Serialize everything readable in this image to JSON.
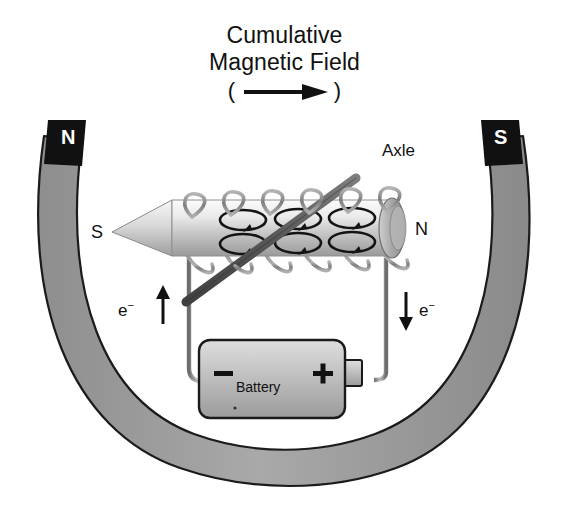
{
  "figure": {
    "type": "diagram",
    "title_line1": "Cumulative",
    "title_line2": "Magnetic Field",
    "title_line3_open": "(",
    "title_line3_arrow": "arrow-right-icon",
    "title_line3_close": ")"
  },
  "horseshoe_magnet": {
    "north_pole_label": "N",
    "south_pole_label": "S",
    "pole_block_color": "#111111",
    "pole_text_color": "#ffffff",
    "band_color": "#9b9b9b",
    "band_outline": "#1a1a1a"
  },
  "solenoid": {
    "left_pole_label": "S",
    "right_pole_label": "N",
    "core_color_light": "#f2f2f2",
    "core_color_dark": "#9d9d9d",
    "coil_color": "#8d8d8d",
    "coil_turns": 6,
    "field_loop_arrows": 6,
    "field_loop_color": "#111111"
  },
  "axle": {
    "label": "Axle",
    "color": "#5e5e5e"
  },
  "circuit": {
    "electron_label_left": "e",
    "electron_sup_left": "−",
    "electron_arrow_left": "arrow-up-icon",
    "electron_label_right": "e",
    "electron_sup_right": "−",
    "electron_arrow_right": "arrow-down-icon",
    "wire_color": "#7d7d7d"
  },
  "battery": {
    "label": "Battery",
    "negative_terminal": "−",
    "positive_terminal": "+",
    "body_color_light": "#d6d6d6",
    "body_color_dark": "#9f9f9f",
    "outline": "#1a1a1a"
  }
}
